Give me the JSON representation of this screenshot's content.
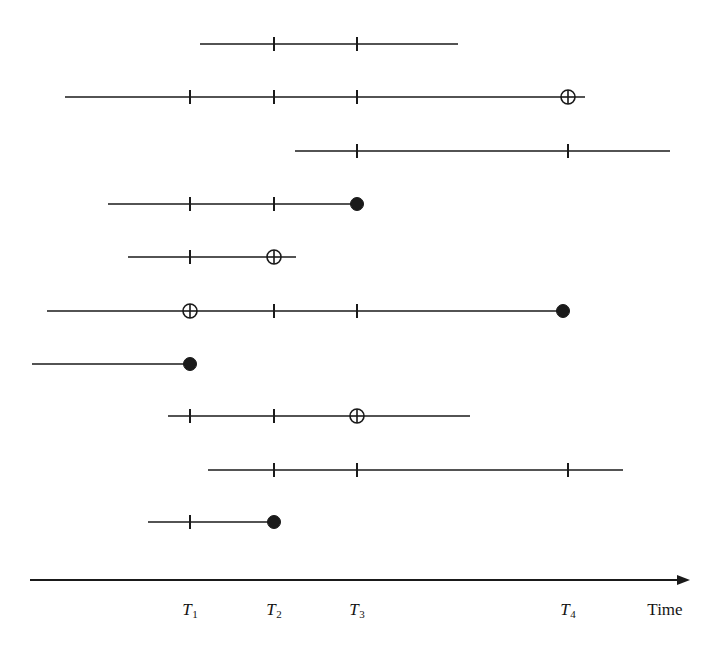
{
  "figure": {
    "type": "timeline-interval-diagram",
    "width": 719,
    "height": 649,
    "background_color": "#ffffff",
    "stroke_color": "#1a1a1a"
  },
  "axis": {
    "name": "time-axis",
    "y": 580,
    "x_start": 30,
    "x_end": 690,
    "arrow": true,
    "title": "Time",
    "title_x": 665,
    "title_y": 600,
    "ticks": [
      {
        "label": "T",
        "sub": "1",
        "x": 190
      },
      {
        "label": "T",
        "sub": "2",
        "x": 274
      },
      {
        "label": "T",
        "sub": "3",
        "x": 357
      },
      {
        "label": "T",
        "sub": "4",
        "x": 568
      }
    ],
    "tick_label_y": 600
  },
  "markers": {
    "tick_half_height": 7,
    "open_circle_radius": 7,
    "filled_dot_radius": 6.5,
    "line_width": 1.6,
    "legend": {
      "tick": "vertical tick mark crossing the interval line",
      "open-cross-circle": "circle with horizontal and vertical cross lines",
      "filled-dot": "solid black endpoint dot"
    }
  },
  "intervals": [
    {
      "id": "interval-1",
      "y": 44,
      "x_start": 200,
      "x_end": 458,
      "marks": [
        {
          "type": "tick",
          "x": 274
        },
        {
          "type": "tick",
          "x": 357
        }
      ]
    },
    {
      "id": "interval-2",
      "y": 97,
      "x_start": 65,
      "x_end": 585,
      "marks": [
        {
          "type": "tick",
          "x": 190
        },
        {
          "type": "tick",
          "x": 274
        },
        {
          "type": "tick",
          "x": 357
        },
        {
          "type": "open-cross-circle",
          "x": 568
        }
      ]
    },
    {
      "id": "interval-3",
      "y": 151,
      "x_start": 295,
      "x_end": 670,
      "marks": [
        {
          "type": "tick",
          "x": 357
        },
        {
          "type": "tick",
          "x": 568
        }
      ]
    },
    {
      "id": "interval-4",
      "y": 204,
      "x_start": 108,
      "x_end": 357,
      "marks": [
        {
          "type": "tick",
          "x": 190
        },
        {
          "type": "tick",
          "x": 274
        },
        {
          "type": "filled-dot",
          "x": 357
        }
      ]
    },
    {
      "id": "interval-5",
      "y": 257,
      "x_start": 128,
      "x_end": 296,
      "marks": [
        {
          "type": "tick",
          "x": 190
        },
        {
          "type": "open-cross-circle",
          "x": 274
        }
      ]
    },
    {
      "id": "interval-6",
      "y": 311,
      "x_start": 47,
      "x_end": 563,
      "marks": [
        {
          "type": "open-cross-circle",
          "x": 190
        },
        {
          "type": "tick",
          "x": 274
        },
        {
          "type": "tick",
          "x": 357
        },
        {
          "type": "filled-dot",
          "x": 563
        }
      ]
    },
    {
      "id": "interval-7",
      "y": 364,
      "x_start": 32,
      "x_end": 190,
      "marks": [
        {
          "type": "filled-dot",
          "x": 190
        }
      ]
    },
    {
      "id": "interval-8",
      "y": 416,
      "x_start": 168,
      "x_end": 470,
      "marks": [
        {
          "type": "tick",
          "x": 190
        },
        {
          "type": "tick",
          "x": 274
        },
        {
          "type": "open-cross-circle",
          "x": 357
        }
      ]
    },
    {
      "id": "interval-9",
      "y": 470,
      "x_start": 208,
      "x_end": 623,
      "marks": [
        {
          "type": "tick",
          "x": 274
        },
        {
          "type": "tick",
          "x": 357
        },
        {
          "type": "tick",
          "x": 568
        }
      ]
    },
    {
      "id": "interval-10",
      "y": 522,
      "x_start": 148,
      "x_end": 274,
      "marks": [
        {
          "type": "tick",
          "x": 190
        },
        {
          "type": "filled-dot",
          "x": 274
        }
      ]
    }
  ]
}
